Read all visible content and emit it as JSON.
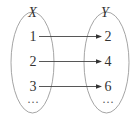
{
  "diagram": {
    "type": "mapping",
    "sets": {
      "domain": {
        "label": "X",
        "elements": [
          "1",
          "2",
          "3"
        ],
        "continuation": "···"
      },
      "codomain": {
        "label": "Y",
        "elements": [
          "2",
          "4",
          "6"
        ],
        "continuation": "···"
      }
    },
    "mappings": [
      {
        "from": "1",
        "to": "2"
      },
      {
        "from": "2",
        "to": "4"
      },
      {
        "from": "3",
        "to": "6"
      }
    ],
    "colors": {
      "oval": "#9a9a9a",
      "text": "#333333",
      "arrow": "#444444"
    }
  }
}
